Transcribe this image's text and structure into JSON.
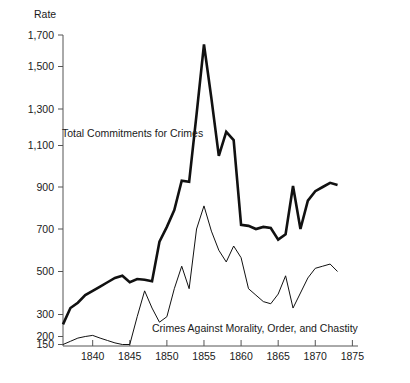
{
  "chart_data": {
    "type": "line",
    "title": "",
    "ylabel": "Rate",
    "xlabel": "",
    "grid": false,
    "legend_position": "inline-annotations",
    "xlim": [
      1836,
      1876
    ],
    "x_ticks": [
      1840,
      1845,
      1850,
      1855,
      1860,
      1865,
      1870,
      1875
    ],
    "x_tick_labels": [
      "1840",
      "1845",
      "1850",
      "1855",
      "1860",
      "1865",
      "1870",
      "1875"
    ],
    "y_ticks": [
      150,
      200,
      300,
      500,
      700,
      900,
      1100,
      1300,
      1500,
      1700
    ],
    "y_tick_labels": [
      "150",
      "200",
      "300",
      "500",
      "700",
      "900",
      "1,100",
      "1,300",
      "1,500",
      "1,700"
    ],
    "y_axis_note": "non-linear: compressed below 300",
    "series": [
      {
        "name": "Total Commitments for Crimes",
        "style": "thick",
        "color": "#111111",
        "label_x": 1839.5,
        "label_y": 1175,
        "x": [
          1836,
          1837,
          1838,
          1839,
          1840,
          1841,
          1842,
          1843,
          1844,
          1845,
          1846,
          1847,
          1848,
          1849,
          1850,
          1851,
          1852,
          1853,
          1854,
          1855,
          1856,
          1857,
          1858,
          1859,
          1860,
          1861,
          1862,
          1863,
          1864,
          1865,
          1866,
          1867,
          1868,
          1869,
          1870,
          1871,
          1872,
          1873
        ],
        "values": [
          255,
          330,
          355,
          390,
          410,
          430,
          450,
          470,
          480,
          450,
          465,
          462,
          455,
          640,
          710,
          790,
          930,
          925,
          1270,
          1640,
          1350,
          1050,
          1175,
          1130,
          720,
          715,
          700,
          710,
          705,
          650,
          675,
          905,
          700,
          835,
          880,
          900,
          920,
          910
        ]
      },
      {
        "name": "Crimes Against Morality, Order, and Chastity",
        "style": "thin",
        "color": "#111111",
        "label_x": 1848.5,
        "label_y": 172,
        "x": [
          1836,
          1837,
          1838,
          1839,
          1840,
          1841,
          1842,
          1843,
          1844,
          1845,
          1846,
          1847,
          1848,
          1849,
          1850,
          1851,
          1852,
          1853,
          1854,
          1855,
          1856,
          1857,
          1858,
          1859,
          1860,
          1861,
          1862,
          1863,
          1864,
          1865,
          1866,
          1867,
          1868,
          1869,
          1870,
          1871,
          1872,
          1873
        ],
        "values": [
          150,
          170,
          190,
          200,
          205,
          190,
          175,
          160,
          150,
          150,
          290,
          410,
          330,
          265,
          290,
          420,
          525,
          420,
          700,
          810,
          690,
          600,
          545,
          620,
          565,
          420,
          390,
          360,
          350,
          395,
          480,
          330,
          400,
          470,
          515,
          525,
          535,
          500
        ]
      }
    ]
  },
  "annotations": {
    "thick_label": "Total Commitments for Crimes",
    "thin_label": "Crimes Against Morality, Order, and Chastity"
  }
}
